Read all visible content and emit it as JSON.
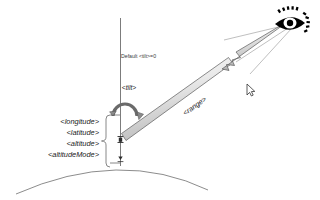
{
  "diagram": {
    "background_color": "#ffffff",
    "line_color": "#4a4a4a",
    "shaft_fill_light": "#f2f2f2",
    "shaft_fill_dark": "#b8b8b8",
    "eye_color": "#000000",
    "labels": {
      "default_tilt": "Default <tilt>=0",
      "tilt": "<tilt>",
      "range": "<range>",
      "longitude": "<longitude>",
      "latitude": "<latitude>",
      "altitude": "<altitude>",
      "altitude_mode": "<altitudeMode>"
    },
    "icons": {
      "eye": "eye-icon",
      "cursor": "mouse-cursor-icon",
      "tilt_arc": "tilt-rotation-arrow-icon",
      "range_arrow": "range-arrow-icon",
      "earth": "earth-surface-arc",
      "axis": "vertical-axis-line",
      "brace": "label-group-brace"
    }
  }
}
